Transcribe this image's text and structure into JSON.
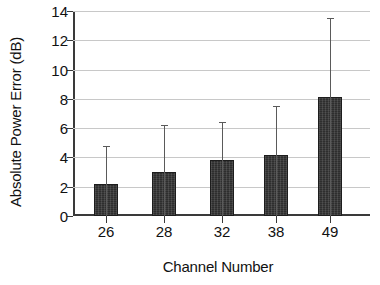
{
  "chart_data": {
    "type": "bar",
    "title": "",
    "xlabel": "Channel Number",
    "ylabel": "Absolute Power Error (dB)",
    "categories": [
      "26",
      "28",
      "32",
      "38",
      "49"
    ],
    "values": [
      2.2,
      3.0,
      3.8,
      4.2,
      8.1
    ],
    "errors_upper": [
      4.8,
      6.2,
      6.4,
      7.5,
      13.5
    ],
    "ylim": [
      0,
      14
    ],
    "yticks": [
      0,
      2,
      4,
      6,
      8,
      10,
      12,
      14
    ],
    "ytick_labels": [
      "0",
      "2",
      "4",
      "6",
      "8",
      "10",
      "12",
      "14"
    ],
    "grid": true,
    "legend": "none",
    "bar_color": "#2e2e2e",
    "grid_color": "#c8c8c8",
    "axis_color": "#3a3a3a"
  }
}
